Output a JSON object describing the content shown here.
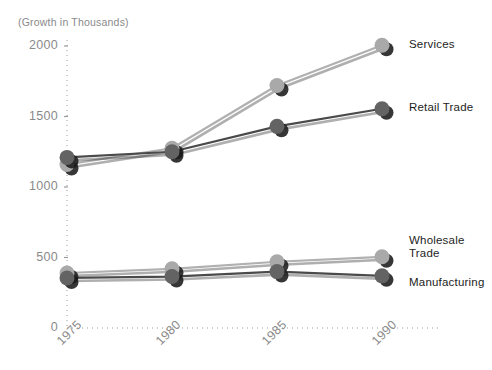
{
  "chart_data": {
    "type": "line",
    "title": "",
    "axis_note": "(Growth in Thousands)",
    "xlabel": "",
    "ylabel": "",
    "categories": [
      "1975",
      "1980",
      "1985",
      "1990"
    ],
    "x_tick_labels": [
      "1975",
      "1980",
      "1985",
      "1990"
    ],
    "y_tick_labels": [
      "0",
      "500",
      "1000",
      "1500",
      "2000"
    ],
    "y_tick_values": [
      0,
      500,
      1000,
      1500,
      2000
    ],
    "ylim": [
      0,
      2100
    ],
    "xlim": [
      1974,
      1992
    ],
    "grid": "dotted",
    "legend_position": "right-inline-labels",
    "series": [
      {
        "name": "Services",
        "color": "#b0b0b0",
        "values": [
          1160,
          1275,
          1720,
          2005
        ]
      },
      {
        "name": "Retail Trade",
        "color": "#4a4a4a",
        "values": [
          1210,
          1250,
          1430,
          1555
        ]
      },
      {
        "name": "Wholesale Trade",
        "color": "#b0b0b0",
        "values": [
          390,
          420,
          470,
          505
        ]
      },
      {
        "name": "Manufacturing",
        "color": "#4a4a4a",
        "values": [
          355,
          365,
          400,
          370
        ]
      }
    ]
  },
  "labels": {
    "axis_note": "(Growth in Thousands)",
    "series_services": "Services",
    "series_retail": "Retail Trade",
    "series_wholesale": "Wholesale\nTrade",
    "series_manufacturing": "Manufacturing",
    "y0": "0",
    "y500": "500",
    "y1000": "1000",
    "y1500": "1500",
    "y2000": "2000",
    "x1975": "1975",
    "x1980": "1980",
    "x1985": "1985",
    "x1990": "1990"
  },
  "colors": {
    "light_series": "#b0b0b0",
    "dark_series": "#4a4a4a",
    "marker_light": "#a9a9a9",
    "marker_dark": "#636363",
    "shadow": "#1a1a1a",
    "tick_text": "#8a8a8a",
    "label_text": "#1d1d1d",
    "grid": "#9b9b9b",
    "background": "#ffffff"
  }
}
